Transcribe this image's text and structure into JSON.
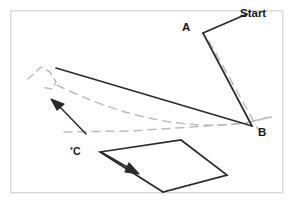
{
  "figure": {
    "kind": "hand-drawn-path-diagram",
    "canvas": {
      "width": 293,
      "height": 205,
      "background": "#ffffff"
    },
    "frame": {
      "name": "figure-border",
      "x": 10,
      "y": 10,
      "width": 273,
      "height": 183,
      "stroke": "#d8d8d8",
      "stroke_width": 1.4
    },
    "colors": {
      "solid_path": "#2b2b2b",
      "dashed_path": "#b9b9b9",
      "frame": "#d8d8d8",
      "label_text": "#1a1a1a"
    },
    "labels": {
      "start": "Start",
      "a": "A",
      "b": "B",
      "c": "C"
    },
    "label_positions": {
      "start": {
        "x": 240,
        "y": 8
      },
      "a": {
        "x": 182,
        "y": 22
      },
      "b": {
        "x": 258,
        "y": 127
      },
      "c": {
        "x": 73,
        "y": 146
      }
    },
    "point_marker_c": {
      "x": 71,
      "y": 148,
      "r": 1.1
    },
    "solid_paths": {
      "start_to_a": [
        [
          246,
          14
        ],
        [
          203,
          33
        ]
      ],
      "a_to_b": [
        [
          203,
          33
        ],
        [
          252,
          126
        ]
      ],
      "b_to_left": [
        [
          252,
          126
        ],
        [
          56,
          68
        ]
      ],
      "quad": [
        [
          100,
          152
        ],
        [
          181,
          140
        ],
        [
          227,
          175
        ],
        [
          163,
          192
        ]
      ]
    },
    "dashed_paths": {
      "upper_hook": [
        [
          30,
          78
        ],
        [
          44,
          68
        ],
        [
          52,
          74
        ],
        [
          56,
          83
        ],
        [
          50,
          88
        ],
        [
          40,
          86
        ]
      ],
      "long_sweep": [
        [
          58,
          86
        ],
        [
          110,
          112
        ],
        [
          170,
          126
        ],
        [
          232,
          124
        ],
        [
          268,
          117
        ]
      ],
      "lower_run": [
        [
          66,
          131
        ],
        [
          130,
          131
        ],
        [
          190,
          128
        ],
        [
          245,
          124
        ]
      ],
      "a_b_parallel": [
        [
          209,
          40
        ],
        [
          258,
          130
        ]
      ]
    },
    "arrows": [
      {
        "name": "arrow-up-left",
        "tail": [
          86,
          133
        ],
        "head": [
          52,
          100
        ],
        "head_size": 12
      },
      {
        "name": "arrow-down-right",
        "tail": [
          101,
          152
        ],
        "head": [
          137,
          173
        ],
        "head_size": 12
      }
    ]
  }
}
